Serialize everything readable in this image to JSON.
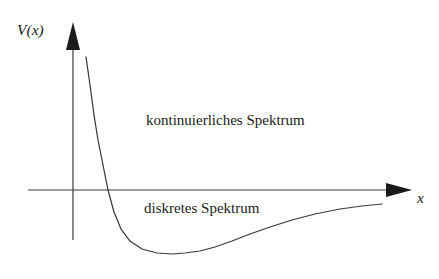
{
  "figure": {
    "kind": "potential-energy-diagram",
    "background_color": "#ffffff",
    "line_color": "#3a3a3a",
    "text_color": "#1a1a1a"
  },
  "axes": {
    "y_label": "V(x)",
    "x_label": "x",
    "y_axis": {
      "x": 73,
      "top": 22,
      "bottom": 240,
      "arrow": "up"
    },
    "x_axis": {
      "y": 190,
      "left": 28,
      "right": 412,
      "arrow": "right"
    }
  },
  "annotations": {
    "continuous_spectrum": "kontinuierliches Spektrum",
    "discrete_spectrum": "diskretes Spektrum"
  },
  "chart_data": {
    "type": "line",
    "title": "",
    "xlabel": "x",
    "ylabel": "V(x)",
    "grid": false,
    "legend": null,
    "annotations": [
      {
        "text": "kontinuierliches Spektrum",
        "region": "above-axis"
      },
      {
        "text": "diskretes Spektrum",
        "region": "below-axis"
      }
    ],
    "series": [
      {
        "name": "V(x)",
        "description": "Lennard-Jones type potential: steep repulsive wall, minimum, asymptotic approach to zero",
        "zero_crossing_px_x": 108,
        "minimum_px": [
          185,
          253
        ],
        "points_px": [
          [
            86,
            57
          ],
          [
            90,
            85
          ],
          [
            94,
            115
          ],
          [
            98,
            140
          ],
          [
            103,
            165
          ],
          [
            108,
            190
          ],
          [
            114,
            212
          ],
          [
            121,
            229
          ],
          [
            130,
            241
          ],
          [
            142,
            249
          ],
          [
            157,
            253
          ],
          [
            172,
            254
          ],
          [
            185,
            253
          ],
          [
            200,
            251
          ],
          [
            215,
            247
          ],
          [
            232,
            241
          ],
          [
            250,
            234
          ],
          [
            270,
            227
          ],
          [
            292,
            220
          ],
          [
            315,
            214
          ],
          [
            340,
            209
          ],
          [
            362,
            206
          ],
          [
            382,
            204
          ]
        ]
      }
    ]
  }
}
